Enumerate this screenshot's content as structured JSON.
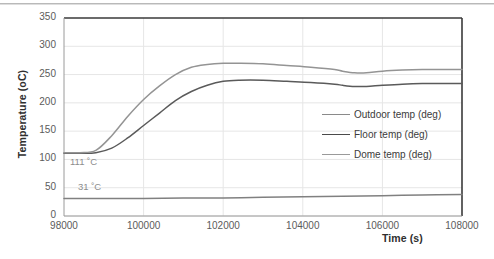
{
  "chart_data": {
    "type": "line",
    "title": "",
    "xlabel": "Time (s)",
    "ylabel": "Temperature (oC)",
    "xlim": [
      98000,
      108000
    ],
    "ylim": [
      0,
      350
    ],
    "xticks": [
      "98000",
      "100000",
      "102000",
      "104000",
      "106000",
      "108000"
    ],
    "yticks": [
      "0",
      "50",
      "100",
      "150",
      "200",
      "250",
      "300",
      "350"
    ],
    "grid": true,
    "legend_position": "center-right",
    "annotations": [
      {
        "text": "111 ˚C",
        "x": 98150,
        "y": 95
      },
      {
        "text": "31 ˚C",
        "x": 98350,
        "y": 52
      }
    ],
    "series": [
      {
        "name": "Outdoor temp (deg)",
        "color": "#808080",
        "x": [
          98000,
          99000,
          100000,
          101000,
          102000,
          103000,
          104000,
          105000,
          106000,
          107000,
          108000
        ],
        "values": [
          31,
          31,
          31,
          32,
          32,
          33,
          34,
          35,
          36,
          37,
          38
        ]
      },
      {
        "name": "Floor temp (deg)",
        "color": "#5a5a5a",
        "x": [
          98000,
          98400,
          98800,
          99200,
          99600,
          100000,
          100400,
          100800,
          101200,
          101600,
          102000,
          102400,
          103000,
          103600,
          104200,
          104800,
          105000,
          105300,
          105600,
          106000,
          106500,
          107000,
          107600,
          108000
        ],
        "values": [
          111,
          111,
          112,
          120,
          138,
          160,
          182,
          204,
          220,
          231,
          238,
          240,
          240,
          238,
          236,
          233,
          231,
          229,
          229,
          231,
          233,
          234,
          234,
          234
        ]
      },
      {
        "name": "Dome temp (deg)",
        "color": "#949494",
        "x": [
          98000,
          98400,
          98800,
          99200,
          99600,
          100000,
          100400,
          100800,
          101200,
          101600,
          102000,
          102400,
          103000,
          103600,
          104200,
          104800,
          105000,
          105300,
          105600,
          106000,
          106500,
          107000,
          107600,
          108000
        ],
        "values": [
          112,
          112,
          116,
          142,
          176,
          206,
          230,
          250,
          263,
          268,
          270,
          270,
          269,
          266,
          263,
          259,
          256,
          253,
          253,
          256,
          258,
          259,
          259,
          259
        ]
      }
    ]
  },
  "legend": {
    "items": [
      {
        "label": "Outdoor temp (deg)",
        "color": "#8a8a8a"
      },
      {
        "label": "Floor temp (deg)",
        "color": "#4a4a4a"
      },
      {
        "label": "Dome temp (deg)",
        "color": "#9a9a9a"
      }
    ]
  }
}
